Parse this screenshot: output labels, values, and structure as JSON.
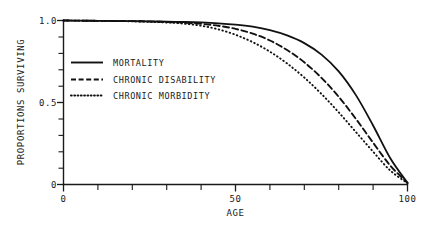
{
  "chart_data": {
    "type": "line",
    "title": "",
    "xlabel": "AGE",
    "ylabel": "PROPORTIONS SURVIVING",
    "xlim": [
      0,
      100
    ],
    "ylim": [
      0,
      1.0
    ],
    "grid": false,
    "legend_position": "upper-left-inside",
    "x_ticks": [
      0,
      10,
      20,
      30,
      40,
      50,
      60,
      70,
      80,
      90,
      100
    ],
    "x_tick_labels": [
      "0",
      "",
      "",
      "",
      "",
      "50",
      "",
      "",
      "",
      "",
      "100"
    ],
    "y_ticks": [
      0,
      0.1,
      0.2,
      0.3,
      0.4,
      0.5,
      0.6,
      0.7,
      0.8,
      0.9,
      1.0
    ],
    "y_tick_labels": [
      "0",
      "",
      "",
      "",
      "",
      "0.5",
      "",
      "",
      "",
      "",
      "1.0"
    ],
    "x_labeled_ticks": [
      {
        "value": 0,
        "label": "0"
      },
      {
        "value": 50,
        "label": "50"
      },
      {
        "value": 100,
        "label": "100"
      }
    ],
    "y_labeled_ticks": [
      {
        "value": 0,
        "label": "0"
      },
      {
        "value": 0.5,
        "label": "0.5"
      },
      {
        "value": 1.0,
        "label": "1.0"
      }
    ],
    "x": [
      0,
      5,
      10,
      15,
      20,
      25,
      30,
      35,
      40,
      45,
      50,
      55,
      60,
      65,
      70,
      75,
      80,
      85,
      90,
      95,
      100
    ],
    "series": [
      {
        "name": "MORTALITY",
        "style": "solid",
        "color": "#111111",
        "values": [
          1.0,
          0.999,
          0.998,
          0.997,
          0.996,
          0.995,
          0.993,
          0.991,
          0.988,
          0.983,
          0.975,
          0.962,
          0.941,
          0.909,
          0.862,
          0.792,
          0.69,
          0.545,
          0.36,
          0.16,
          0.01
        ]
      },
      {
        "name": "CHRONIC DISABILITY",
        "style": "dashed",
        "color": "#111111",
        "values": [
          1.0,
          0.999,
          0.998,
          0.997,
          0.996,
          0.994,
          0.991,
          0.987,
          0.98,
          0.968,
          0.949,
          0.92,
          0.878,
          0.82,
          0.745,
          0.65,
          0.535,
          0.4,
          0.255,
          0.115,
          0.01
        ]
      },
      {
        "name": "CHRONIC MORBIDITY",
        "style": "dotted",
        "color": "#111111",
        "values": [
          1.0,
          0.999,
          0.998,
          0.997,
          0.995,
          0.992,
          0.988,
          0.981,
          0.968,
          0.946,
          0.913,
          0.868,
          0.81,
          0.738,
          0.652,
          0.552,
          0.44,
          0.32,
          0.2,
          0.085,
          0.008
        ]
      }
    ],
    "legend_entries": [
      {
        "label": "MORTALITY",
        "style": "solid"
      },
      {
        "label": "CHRONIC DISABILITY",
        "style": "dashed"
      },
      {
        "label": "CHRONIC MORBIDITY",
        "style": "dotted"
      }
    ],
    "colors": {
      "axis": "#1a1a1a",
      "curve": "#111111",
      "background": "#ffffff"
    }
  }
}
